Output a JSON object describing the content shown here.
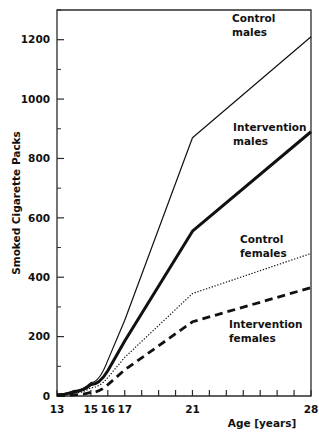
{
  "chart_data": {
    "type": "line",
    "title": "",
    "xlabel": "Age [years]",
    "ylabel": "Smoked Cigarette Packs",
    "xlim": [
      13,
      28
    ],
    "ylim": [
      0,
      1300
    ],
    "grid": false,
    "legend_position": "inline-annotations",
    "x_tick_values": [
      13,
      14,
      15,
      16,
      17,
      18,
      19,
      20,
      21,
      22,
      23,
      24,
      25,
      26,
      27,
      28
    ],
    "x_tick_labels": [
      "13",
      "",
      "15",
      "16",
      "17",
      "",
      "",
      "",
      "21",
      "",
      "",
      "",
      "",
      "",
      "",
      "28"
    ],
    "y_tick_values": [
      0,
      100,
      200,
      300,
      400,
      500,
      600,
      700,
      800,
      900,
      1000,
      1100,
      1200,
      1300
    ],
    "y_tick_labels": [
      "0",
      "",
      "200",
      "",
      "400",
      "",
      "600",
      "",
      "800",
      "",
      "1000",
      "",
      "1200",
      ""
    ],
    "x": [
      13,
      14,
      15,
      16,
      17,
      21,
      28
    ],
    "series": [
      {
        "name": "Control males",
        "label_lines": [
          "Control",
          "males"
        ],
        "style": "thin-solid",
        "values": [
          5,
          18,
          45,
          120,
          255,
          870,
          1210
        ]
      },
      {
        "name": "Intervention males",
        "label_lines": [
          "Intervention",
          "males"
        ],
        "style": "thick-solid",
        "values": [
          4,
          14,
          38,
          85,
          185,
          555,
          890
        ]
      },
      {
        "name": "Control females",
        "label_lines": [
          "Control",
          "females"
        ],
        "style": "dotted",
        "values": [
          3,
          10,
          28,
          62,
          130,
          345,
          480
        ]
      },
      {
        "name": "Intervention females",
        "label_lines": [
          "Intervention",
          "females"
        ],
        "style": "dashed",
        "values": [
          1,
          4,
          12,
          38,
          88,
          250,
          365
        ]
      }
    ],
    "annotations": [
      {
        "text_lines": [
          "Control",
          "males"
        ],
        "for_series": "Control males"
      },
      {
        "text_lines": [
          "Intervention",
          "males"
        ],
        "for_series": "Intervention males"
      },
      {
        "text_lines": [
          "Control",
          "females"
        ],
        "for_series": "Control females"
      },
      {
        "text_lines": [
          "Intervention",
          "females"
        ],
        "for_series": "Intervention females"
      }
    ]
  }
}
